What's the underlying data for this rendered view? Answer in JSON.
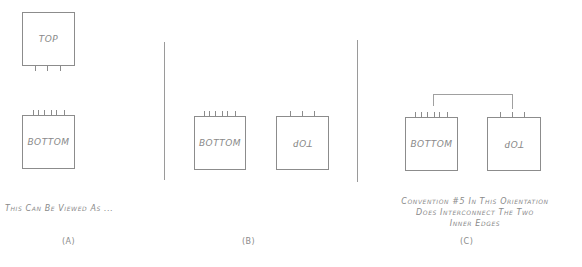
{
  "panels": {
    "a": {
      "top_label": "TOP",
      "bottom_label": "BOTTOM",
      "caption": "This Can Be Viewed As ...",
      "tag": "(A)"
    },
    "b": {
      "bottom_label": "BOTTOM",
      "top_label": "TOP",
      "tag": "(B)"
    },
    "c": {
      "bottom_label": "BOTTOM",
      "top_label": "TOP",
      "caption_lines": [
        "Convention #5 In This Orientation",
        "Does Interconnect The Two",
        "Inner Edges"
      ],
      "tag": "(C)"
    }
  },
  "colors": {
    "line": "#8c8c8c",
    "text": "#8a8a8a",
    "background": "#ffffff"
  }
}
